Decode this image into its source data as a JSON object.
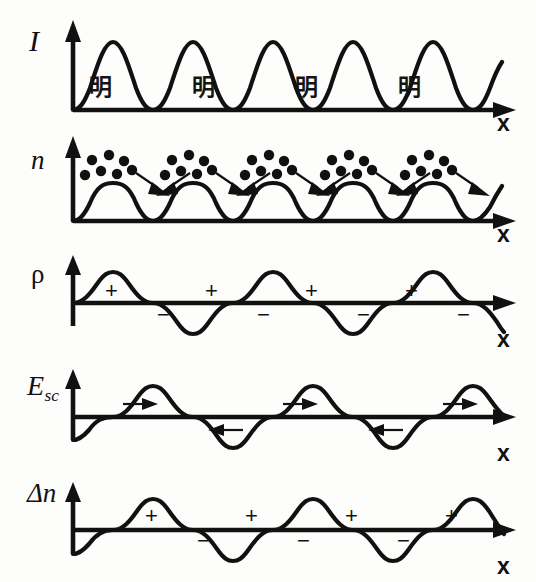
{
  "figure": {
    "background_color": "#fdfdfb",
    "ink_color": "#111111",
    "width": 536,
    "height": 582
  },
  "x_axis_label": "x",
  "panels": [
    {
      "id": "intensity",
      "y_label": "I",
      "y_label_style": "italic",
      "x_label": "x",
      "wave_type": "sin_squared",
      "baseline": "bottom",
      "periods": 4,
      "region_labels": [
        "明",
        "明",
        "明",
        "明"
      ],
      "region_label_meaning": "bright fringe",
      "dots": false,
      "signs": [],
      "arrows": []
    },
    {
      "id": "carrier-density",
      "y_label": "n",
      "y_label_style": "italic",
      "x_label": "x",
      "wave_type": "sin_squared",
      "baseline": "bottom",
      "periods": 4,
      "region_labels": [],
      "dots": true,
      "dot_clusters": 4,
      "dots_per_cluster": 7,
      "signs": [],
      "arrows": [
        "down-right",
        "down-left",
        "down-right",
        "down-left",
        "down-right",
        "down-left",
        "down-right"
      ]
    },
    {
      "id": "space-charge-density",
      "y_label": "ρ",
      "y_label_style": "upright",
      "x_label": "x",
      "wave_type": "sine",
      "baseline": "center",
      "periods": 4,
      "phase": "positive-first",
      "region_labels": [],
      "dots": false,
      "signs": [
        "+",
        "−",
        "+",
        "−",
        "+",
        "−",
        "+",
        "−"
      ],
      "arrows": []
    },
    {
      "id": "space-charge-field",
      "y_label": "E",
      "y_label_sub": "sc",
      "y_label_style": "italic",
      "x_label": "x",
      "wave_type": "sine",
      "baseline": "center",
      "periods": 4,
      "phase": "negative-first",
      "region_labels": [],
      "dots": false,
      "signs": [],
      "arrows": [
        "right",
        "left",
        "right",
        "left",
        "right",
        "left",
        "right"
      ]
    },
    {
      "id": "index-change",
      "y_label": "Δn",
      "y_label_style": "italic",
      "x_label": "x",
      "wave_type": "sine",
      "baseline": "center",
      "periods": 4,
      "phase": "negative-first",
      "region_labels": [],
      "dots": false,
      "signs": [
        "+",
        "−",
        "+",
        "−",
        "+",
        "−",
        "+"
      ],
      "arrows": []
    }
  ]
}
